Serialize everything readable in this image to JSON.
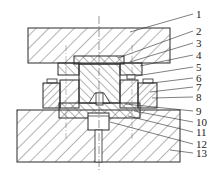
{
  "diagram": {
    "type": "mechanical-assembly-cross-section",
    "callouts": [
      {
        "number": "1",
        "x": 196,
        "y": 17,
        "tx": 130,
        "ty": 32
      },
      {
        "number": "2",
        "x": 196,
        "y": 34,
        "tx": 118,
        "ty": 58
      },
      {
        "number": "3",
        "x": 196,
        "y": 46,
        "tx": 130,
        "ty": 62
      },
      {
        "number": "4",
        "x": 196,
        "y": 58,
        "tx": 140,
        "ty": 66
      },
      {
        "number": "5",
        "x": 196,
        "y": 70,
        "tx": 136,
        "ty": 76
      },
      {
        "number": "6",
        "x": 196,
        "y": 81,
        "tx": 152,
        "ty": 83
      },
      {
        "number": "7",
        "x": 196,
        "y": 90,
        "tx": 150,
        "ty": 92
      },
      {
        "number": "8",
        "x": 196,
        "y": 100,
        "tx": 152,
        "ty": 98
      },
      {
        "number": "9",
        "x": 196,
        "y": 114,
        "tx": 125,
        "ty": 104
      },
      {
        "number": "10",
        "x": 196,
        "y": 125,
        "tx": 134,
        "ty": 111
      },
      {
        "number": "11",
        "x": 196,
        "y": 135,
        "tx": 128,
        "ty": 116
      },
      {
        "number": "12",
        "x": 196,
        "y": 147,
        "tx": 110,
        "ty": 122
      },
      {
        "number": "13",
        "x": 196,
        "y": 156,
        "tx": 170,
        "ty": 150
      }
    ],
    "colors": {
      "line": "#2a2a2a",
      "hatch": "#444444",
      "background": "#ffffff"
    }
  }
}
